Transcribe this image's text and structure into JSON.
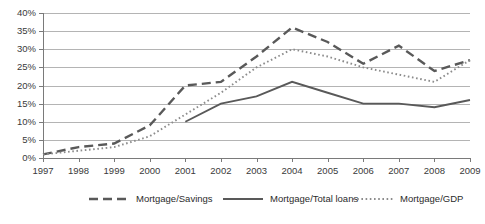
{
  "chart_data": {
    "type": "line",
    "title": "",
    "subtitle": "",
    "xlabel": "",
    "ylabel": "",
    "grid": true,
    "legend_position": "bottom",
    "categories": [
      "1997",
      "1998",
      "1999",
      "2000",
      "2001",
      "2002",
      "2003",
      "2004",
      "2005",
      "2006",
      "2007",
      "2008",
      "2009"
    ],
    "x": [
      1997,
      1998,
      1999,
      2000,
      2001,
      2002,
      2003,
      2004,
      2005,
      2006,
      2007,
      2008,
      2009
    ],
    "ylim": [
      0,
      40
    ],
    "ytick_labels": [
      "0%",
      "5%",
      "10%",
      "15%",
      "20%",
      "25%",
      "30%",
      "35%",
      "40%"
    ],
    "ytick_values": [
      0,
      5,
      10,
      15,
      20,
      25,
      30,
      35,
      40
    ],
    "y_unit": "%",
    "series": [
      {
        "name": "Mortgage/Savings",
        "style": "dashed",
        "color": "#595959",
        "values": [
          1,
          3,
          4,
          9,
          20,
          21,
          28,
          36,
          32,
          26,
          31,
          24,
          27
        ]
      },
      {
        "name": "Mortgage/Total loans",
        "style": "solid",
        "color": "#595959",
        "values": [
          null,
          null,
          null,
          null,
          10,
          15,
          17,
          21,
          18,
          15,
          15,
          14,
          16
        ]
      },
      {
        "name": "Mortgage/GDP",
        "style": "dotted",
        "color": "#8c8c8c",
        "values": [
          1,
          2,
          3,
          6,
          12,
          18,
          25,
          30,
          28,
          25,
          23,
          21,
          27
        ]
      }
    ]
  },
  "legend": {
    "items": [
      {
        "label": "Mortgage/Savings",
        "style": "dashed"
      },
      {
        "label": "Mortgage/Total loans",
        "style": "solid"
      },
      {
        "label": "Mortgage/GDP",
        "style": "dotted"
      }
    ]
  }
}
